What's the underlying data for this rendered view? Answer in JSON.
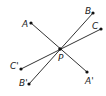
{
  "diagram": {
    "type": "point-reflection",
    "center": {
      "label": "P",
      "x": 60,
      "y": 49,
      "lx": 58,
      "ly": 61
    },
    "points": [
      {
        "label": "A",
        "x": 31,
        "y": 23,
        "lx": 22,
        "ly": 27
      },
      {
        "label": "B",
        "x": 93,
        "y": 13,
        "lx": 85,
        "ly": 14
      },
      {
        "label": "C",
        "x": 101,
        "y": 29,
        "lx": 92,
        "ly": 29
      },
      {
        "label": "A'",
        "x": 87,
        "y": 72,
        "lx": 85,
        "ly": 84
      },
      {
        "label": "B'",
        "x": 29,
        "y": 84,
        "lx": 19,
        "ly": 86
      },
      {
        "label": "C'",
        "x": 21,
        "y": 69,
        "lx": 10,
        "ly": 69
      }
    ],
    "segments": [
      {
        "from": "A",
        "to": "A'"
      },
      {
        "from": "B",
        "to": "B'"
      },
      {
        "from": "C",
        "to": "C'"
      }
    ],
    "colors": {
      "line": "#333333",
      "point": "#111111",
      "label": "#222222"
    }
  }
}
